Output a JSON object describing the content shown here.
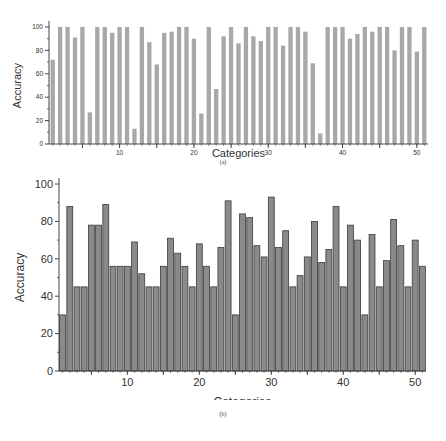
{
  "colors": {
    "top_bar_fill": "#a8a8a8",
    "bottom_bar_fill": "#8a8a8a",
    "bottom_bar_stroke": "#3a3a3a",
    "axis": "#444444"
  },
  "chart_data": [
    {
      "type": "bar",
      "panel": "(a)",
      "title": "",
      "xlabel": "Categories",
      "ylabel": "Accuracy",
      "ylim": [
        0,
        100
      ],
      "xlim": [
        0.5,
        51.5
      ],
      "yticks": [
        0,
        20,
        40,
        60,
        80,
        100
      ],
      "xticks": [
        10,
        20,
        30,
        40,
        50
      ],
      "grid": false,
      "legend": null,
      "categories": [
        1,
        2,
        3,
        4,
        5,
        6,
        7,
        8,
        9,
        10,
        11,
        12,
        13,
        14,
        15,
        16,
        17,
        18,
        19,
        20,
        21,
        22,
        23,
        24,
        25,
        26,
        27,
        28,
        29,
        30,
        31,
        32,
        33,
        34,
        35,
        36,
        37,
        38,
        39,
        40,
        41,
        42,
        43,
        44,
        45,
        46,
        47,
        48,
        49,
        50,
        51
      ],
      "values": [
        72,
        100,
        100,
        91,
        100,
        27,
        100,
        100,
        95,
        100,
        100,
        13,
        100,
        87,
        68,
        95,
        96,
        100,
        100,
        90,
        26,
        100,
        47,
        92,
        100,
        86,
        100,
        92,
        88,
        100,
        100,
        84,
        100,
        100,
        96,
        69,
        9,
        100,
        100,
        100,
        90,
        94,
        100,
        96,
        100,
        100,
        80,
        100,
        100,
        79,
        100
      ]
    },
    {
      "type": "bar",
      "panel": "(b)",
      "title": "",
      "xlabel": "Categories",
      "ylabel": "Accuracy",
      "ylim": [
        0,
        100
      ],
      "xlim": [
        0.5,
        51.5
      ],
      "yticks": [
        0,
        20,
        40,
        60,
        80,
        100
      ],
      "xticks": [
        10,
        20,
        30,
        40,
        50
      ],
      "grid": false,
      "legend": null,
      "categories": [
        1,
        2,
        3,
        4,
        5,
        6,
        7,
        8,
        9,
        10,
        11,
        12,
        13,
        14,
        15,
        16,
        17,
        18,
        19,
        20,
        21,
        22,
        23,
        24,
        25,
        26,
        27,
        28,
        29,
        30,
        31,
        32,
        33,
        34,
        35,
        36,
        37,
        38,
        39,
        40,
        41,
        42,
        43,
        44,
        45,
        46,
        47,
        48,
        49,
        50,
        51
      ],
      "values": [
        30,
        88,
        45,
        45,
        78,
        78,
        89,
        56,
        56,
        56,
        69,
        52,
        45,
        45,
        56,
        71,
        63,
        56,
        45,
        68,
        56,
        45,
        66,
        91,
        30,
        84,
        82,
        67,
        61,
        93,
        66,
        75,
        45,
        51,
        61,
        80,
        58,
        65,
        88,
        45,
        78,
        70,
        30,
        73,
        45,
        59,
        81,
        67,
        45,
        70,
        56
      ]
    }
  ],
  "captions": {
    "a": "(a)",
    "b": "(b)"
  }
}
